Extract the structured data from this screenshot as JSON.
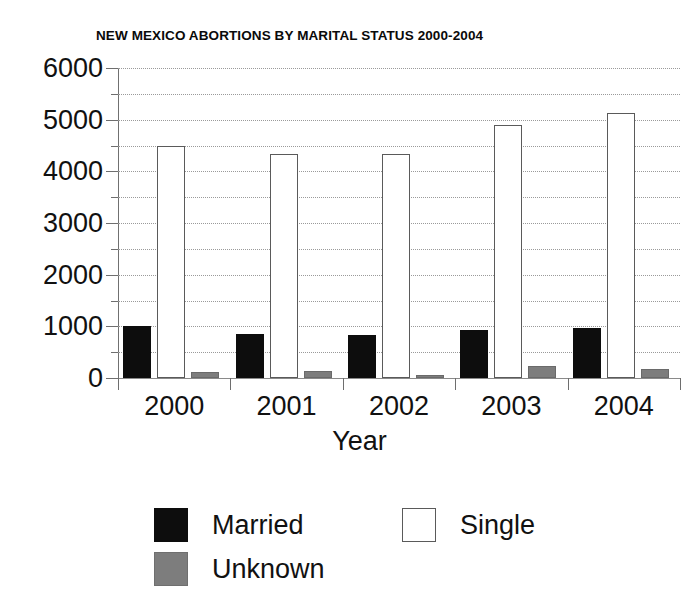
{
  "chart_data": {
    "type": "bar",
    "title": "NEW MEXICO ABORTIONS BY MARITAL STATUS 2000-2004",
    "xlabel": "Year",
    "ylabel": "",
    "categories": [
      "2000",
      "2001",
      "2002",
      "2003",
      "2004"
    ],
    "series": [
      {
        "name": "Married",
        "color": "#0d0d0d",
        "values": [
          965,
          820,
          790,
          900,
          930
        ]
      },
      {
        "name": "Single",
        "color": "#ffffff",
        "values": [
          4450,
          4290,
          4290,
          4850,
          5100
        ]
      },
      {
        "name": "Unknown",
        "color": "#7d7d7d",
        "values": [
          85,
          90,
          25,
          195,
          145
        ]
      }
    ],
    "ylim": [
      0,
      6000
    ],
    "ytick_labels": [
      "0",
      "1000",
      "2000",
      "3000",
      "4000",
      "5000",
      "6000"
    ],
    "ytick_values": [
      0,
      1000,
      2000,
      3000,
      4000,
      5000,
      6000
    ],
    "yminor_step": 500,
    "grid": true,
    "grid_style": "dotted",
    "legend_position": "bottom-left",
    "legend": [
      {
        "label": "Married",
        "swatch": "married"
      },
      {
        "label": "Single",
        "swatch": "single"
      },
      {
        "label": "Unknown",
        "swatch": "unknown"
      }
    ]
  }
}
